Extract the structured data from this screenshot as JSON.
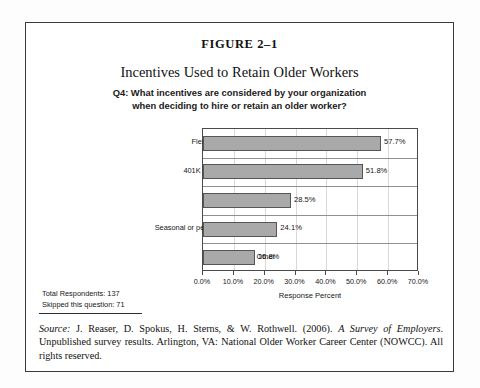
{
  "figure": {
    "number": "FIGURE 2–1",
    "title": "Incentives Used to Retain Older Workers",
    "subtitle_line1": "Q4: What incentives are considered by your organization",
    "subtitle_line2": "when deciding to hire or retain an older worker?"
  },
  "stats": {
    "total_respondents": "Total Respondents: 137",
    "skipped": "Skipped this question: 71"
  },
  "source": {
    "label": "Source:",
    "text_before_italic": " J. Reaser, D. Spokus, H. Sterns, & W. Rothwell. (2006). ",
    "italic_work": "A Survey of Employers",
    "text_after_italic": ". Unpublished survey results. Arlington, VA: National Older Worker Career Center (NOWCC). All rights reserved."
  },
  "chart_data": {
    "type": "bar",
    "orientation": "horizontal",
    "title": "Incentives Used to Retain Older Workers",
    "subtitle": "Q4: What incentives are considered by your organization when deciding to hire or retain an older worker?",
    "xlabel": "Response Percent",
    "ylabel": "",
    "xlim": [
      0,
      70
    ],
    "xtick_labels": [
      "0.0%",
      "10.0%",
      "20.0%",
      "30.0%",
      "40.0%",
      "50.0%",
      "60.0%",
      "70.0%"
    ],
    "xticks": [
      0,
      10,
      20,
      30,
      40,
      50,
      60,
      70
    ],
    "grid": true,
    "legend": "none",
    "bar_color": "#a9a9a9",
    "bar_edge_color": "#555555",
    "categories": [
      "Flex-time work schedules",
      "401K catch-up contributions",
      "Optional benefits",
      "Seasonal or periodic work schedules",
      "Other"
    ],
    "values": [
      57.7,
      51.8,
      28.5,
      24.1,
      16.8
    ],
    "value_labels": [
      "57.7%",
      "51.8%",
      "28.5%",
      "24.1%",
      "16.8%"
    ]
  }
}
